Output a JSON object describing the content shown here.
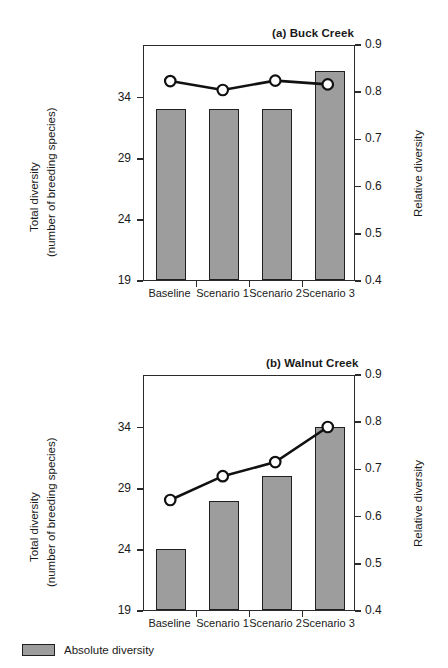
{
  "figure": {
    "legend": {
      "label": "Absolute diversity",
      "swatch_name": "absolute-diversity-swatch"
    },
    "colors": {
      "bar_fill": "#9d9d9d",
      "bar_stroke": "#1f1f1f",
      "line": "#111111",
      "marker_fill": "#ffffff",
      "axis": "#2b2b2b"
    }
  },
  "panels": [
    {
      "id": "a",
      "title": "(a) Buck Creek",
      "left_axis_title_line1": "Total diversity",
      "left_axis_title_line2": "(number of breeding species)",
      "right_axis_title": "Relative diversity",
      "left_ticks": [
        "19",
        "24",
        "29",
        "34"
      ],
      "right_ticks": [
        "0.4",
        "0.5",
        "0.6",
        "0.7",
        "0.8",
        "0.9"
      ],
      "categories": [
        "Baseline",
        "Scenario 1",
        "Scenario 2",
        "Scenario 3"
      ]
    },
    {
      "id": "b",
      "title": "(b) Walnut Creek",
      "left_axis_title_line1": "Total diversity",
      "left_axis_title_line2": "(number of breeding species)",
      "right_axis_title": "Relative diversity",
      "left_ticks": [
        "19",
        "24",
        "29",
        "34"
      ],
      "right_ticks": [
        "0.4",
        "0.5",
        "0.6",
        "0.7",
        "0.8",
        "0.9"
      ],
      "categories": [
        "Baseline",
        "Scenario 1",
        "Scenario 2",
        "Scenario 3"
      ]
    }
  ],
  "chart_data": [
    {
      "type": "bar",
      "title": "(a) Buck Creek",
      "xlabel": "",
      "ylabel": "Total diversity (number of breeding species)",
      "y2label": "Relative diversity",
      "categories": [
        "Baseline",
        "Scenario 1",
        "Scenario 2",
        "Scenario 3"
      ],
      "ylim": [
        19,
        38.3
      ],
      "y2lim": [
        0.4,
        0.9
      ],
      "yticks": [
        19,
        24,
        29,
        34
      ],
      "y2ticks": [
        0.4,
        0.5,
        0.6,
        0.7,
        0.8,
        0.9
      ],
      "grid": false,
      "legend": "Absolute diversity",
      "legend_position": "below-figure-left",
      "series": [
        {
          "name": "Absolute diversity",
          "type": "bar",
          "axis": "left",
          "values": [
            33.0,
            33.0,
            33.0,
            36.1
          ]
        },
        {
          "name": "Relative diversity",
          "type": "line",
          "axis": "right",
          "marker": "open-circle",
          "values": [
            0.825,
            0.806,
            0.826,
            0.818
          ]
        }
      ]
    },
    {
      "type": "bar",
      "title": "(b) Walnut Creek",
      "xlabel": "",
      "ylabel": "Total diversity (number of breeding species)",
      "y2label": "Relative diversity",
      "categories": [
        "Baseline",
        "Scenario 1",
        "Scenario 2",
        "Scenario 3"
      ],
      "ylim": [
        19,
        38.3
      ],
      "y2lim": [
        0.4,
        0.9
      ],
      "yticks": [
        19,
        24,
        29,
        34
      ],
      "y2ticks": [
        0.4,
        0.5,
        0.6,
        0.7,
        0.8,
        0.9
      ],
      "grid": false,
      "legend": "Absolute diversity",
      "legend_position": "below-figure-left",
      "series": [
        {
          "name": "Absolute diversity",
          "type": "bar",
          "axis": "left",
          "values": [
            24.0,
            27.9,
            30.0,
            34.0
          ]
        },
        {
          "name": "Relative diversity",
          "type": "line",
          "axis": "right",
          "marker": "open-circle",
          "values": [
            0.635,
            0.686,
            0.716,
            0.791
          ]
        }
      ]
    }
  ]
}
